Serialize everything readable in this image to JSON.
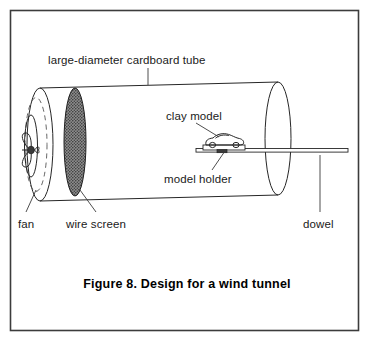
{
  "figure": {
    "caption": "Figure 8.  Design for a wind tunnel",
    "caption_number": "Figure 8.",
    "caption_title": "Design for a wind tunnel",
    "border_color": "#3c3c3c",
    "ink_color": "#262626",
    "background_color": "#ffffff",
    "screen_fill_color": "#6e6e6e"
  },
  "labels": {
    "tube": "large-diameter cardboard tube",
    "clay_model": "clay model",
    "model_holder": "model holder",
    "fan": "fan",
    "wire_screen": "wire screen",
    "dowel": "dowel"
  },
  "parts": [
    {
      "id": "tube",
      "name": "large-diameter cardboard tube"
    },
    {
      "id": "fan",
      "name": "fan"
    },
    {
      "id": "wire-screen",
      "name": "wire screen"
    },
    {
      "id": "clay-model",
      "name": "clay model"
    },
    {
      "id": "model-holder",
      "name": "model holder"
    },
    {
      "id": "dowel",
      "name": "dowel"
    }
  ]
}
